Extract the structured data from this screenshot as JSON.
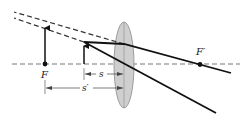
{
  "diagram": {
    "labels": {
      "focal_point_left": "F",
      "focal_point_right": "F′",
      "object_distance": "s",
      "image_distance": "s′"
    },
    "colors": {
      "ray": "#111111",
      "axis": "#777777",
      "lens_fill": "#cfcfcf",
      "lens_stroke": "#8a8a8a",
      "dimension": "#444444"
    },
    "elements": {
      "optical_axis": "dashed horizontal line",
      "lens": "thin convex lens",
      "object_arrow": "small upright arrow inside focal length",
      "image_arrow": "large upright virtual image at F",
      "rays": [
        "parallel ray refracting through F′",
        "ray through lens center"
      ],
      "virtual_extensions": 2
    }
  }
}
